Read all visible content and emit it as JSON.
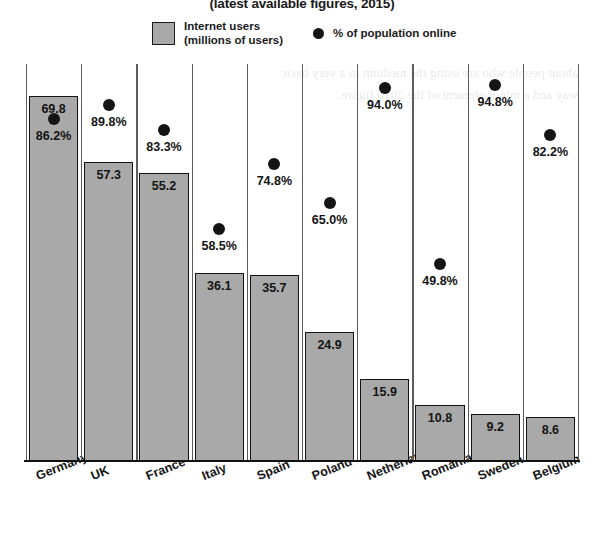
{
  "title": "(latest available figures, 2015)",
  "legend": {
    "bar_line1": "Internet users",
    "bar_line2": "(millions of users)",
    "dot_label": "% of population online",
    "bar_color": "#a9a9a9",
    "dot_color": "#141414"
  },
  "chart_data": {
    "type": "bar",
    "title": "(latest available figures, 2015)",
    "xlabel": "",
    "ylabel": "",
    "grid": true,
    "legend_position": "top",
    "categories": [
      "Germany",
      "UK",
      "France",
      "Italy",
      "Spain",
      "Poland",
      "Netherlands",
      "Romania",
      "Sweden",
      "Belgium"
    ],
    "series": [
      {
        "name": "Internet users (millions of users)",
        "type": "bar",
        "values": [
          69.8,
          57.3,
          55.2,
          36.1,
          35.7,
          24.9,
          15.9,
          10.8,
          9.2,
          8.6
        ],
        "labels": [
          "69.8",
          "57.3",
          "55.2",
          "36.1",
          "35.7",
          "24.9",
          "15.9",
          "10.8",
          "9.2",
          "8.6"
        ],
        "ylim": [
          0,
          76
        ]
      },
      {
        "name": "% of population online",
        "type": "scatter",
        "values": [
          86.2,
          89.8,
          83.3,
          58.5,
          74.8,
          65.0,
          94.0,
          49.8,
          94.8,
          82.2
        ],
        "labels": [
          "86.2%",
          "89.8%",
          "83.3%",
          "58.5%",
          "74.8%",
          "65.0%",
          "94.0%",
          "49.8%",
          "94.8%",
          "82.2%"
        ],
        "ylim": [
          0,
          100
        ]
      }
    ]
  },
  "bleed_text": [
    "about people who are using the medium in a very basic",
    "way and a minor element of the 2010 figure."
  ]
}
